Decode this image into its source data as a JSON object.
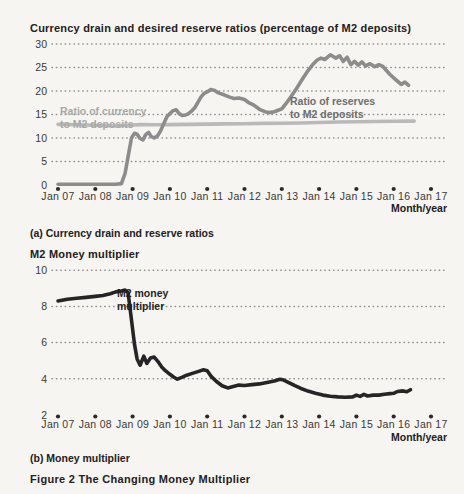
{
  "figure": {
    "caption": "Figure 2 The Changing Money Multiplier"
  },
  "chart_data": [
    {
      "type": "line",
      "title": "Currency drain and desired reserve ratios (percentage of M2 deposits)",
      "panel_label": "(a) Currency drain and reserve ratios",
      "xlabel": "Month/year",
      "x_unit": "years since Jan 2007",
      "x_tick_labels": [
        "Jan 07",
        "Jan 08",
        "Jan 09",
        "Jan 10",
        "Jan 11",
        "Jan 12",
        "Jan 13",
        "Jan 14",
        "Jan 15",
        "Jan 16",
        "Jan 17"
      ],
      "ylim": [
        0,
        30
      ],
      "y_tick_labels": [
        0,
        5,
        10,
        15,
        20,
        25,
        30
      ],
      "y_gridlines": [
        5,
        10,
        15,
        20,
        25,
        30
      ],
      "grid": "dotted-horizontal",
      "legend_position": "inline-labels",
      "series": [
        {
          "name": "Ratio of currency to M2 deposits",
          "label_lines": [
            "Ratio of currency",
            "to M2 deposits"
          ],
          "color": "#b9b9b9",
          "label_color": "#a8a8a8",
          "label_x": 60,
          "label_y": 115,
          "points": [
            [
              0,
              12.9
            ],
            [
              0.5,
              12.8
            ],
            [
              1.0,
              12.7
            ],
            [
              1.3,
              12.6
            ],
            [
              1.6,
              12.55
            ],
            [
              1.9,
              12.7
            ],
            [
              2.2,
              12.85
            ],
            [
              2.6,
              12.8
            ],
            [
              3.0,
              12.85
            ],
            [
              3.5,
              12.9
            ],
            [
              4.0,
              12.95
            ],
            [
              4.5,
              13.0
            ],
            [
              5.0,
              13.05
            ],
            [
              5.5,
              13.1
            ],
            [
              6.0,
              13.15
            ],
            [
              6.5,
              13.2
            ],
            [
              7.0,
              13.3
            ],
            [
              7.5,
              13.4
            ],
            [
              8.0,
              13.45
            ],
            [
              8.5,
              13.5
            ],
            [
              9.0,
              13.55
            ],
            [
              9.55,
              13.6
            ]
          ]
        },
        {
          "name": "Ratio of reserves to M2 deposits",
          "label_lines": [
            "Ratio of reserves",
            "to M2 deposits"
          ],
          "color": "#8c8c8c",
          "label_color": "#6e6e6e",
          "label_x": 290,
          "label_y": 105,
          "points": [
            [
              0,
              0.15
            ],
            [
              1.55,
              0.15
            ],
            [
              1.7,
              0.3
            ],
            [
              1.8,
              2.5
            ],
            [
              1.9,
              7.0
            ],
            [
              1.97,
              10.0
            ],
            [
              2.05,
              11.0
            ],
            [
              2.12,
              10.8
            ],
            [
              2.2,
              9.9
            ],
            [
              2.28,
              9.6
            ],
            [
              2.35,
              10.7
            ],
            [
              2.43,
              11.2
            ],
            [
              2.5,
              10.3
            ],
            [
              2.58,
              10.0
            ],
            [
              2.67,
              10.5
            ],
            [
              2.75,
              11.5
            ],
            [
              2.83,
              13.0
            ],
            [
              2.92,
              14.5
            ],
            [
              3.0,
              15.2
            ],
            [
              3.08,
              15.8
            ],
            [
              3.17,
              16.0
            ],
            [
              3.25,
              15.2
            ],
            [
              3.33,
              14.8
            ],
            [
              3.42,
              14.9
            ],
            [
              3.5,
              15.2
            ],
            [
              3.58,
              15.7
            ],
            [
              3.67,
              16.5
            ],
            [
              3.75,
              17.6
            ],
            [
              3.83,
              18.7
            ],
            [
              3.92,
              19.5
            ],
            [
              4.0,
              19.8
            ],
            [
              4.1,
              20.3
            ],
            [
              4.2,
              20.1
            ],
            [
              4.3,
              19.6
            ],
            [
              4.45,
              19.2
            ],
            [
              4.6,
              18.7
            ],
            [
              4.72,
              18.4
            ],
            [
              4.85,
              18.5
            ],
            [
              5.0,
              18.2
            ],
            [
              5.1,
              17.6
            ],
            [
              5.25,
              17.0
            ],
            [
              5.4,
              16.1
            ],
            [
              5.55,
              15.6
            ],
            [
              5.65,
              15.4
            ],
            [
              5.8,
              15.6
            ],
            [
              5.9,
              15.9
            ],
            [
              6.0,
              16.2
            ],
            [
              6.1,
              17.2
            ],
            [
              6.25,
              18.8
            ],
            [
              6.4,
              20.6
            ],
            [
              6.55,
              22.5
            ],
            [
              6.7,
              24.3
            ],
            [
              6.85,
              25.8
            ],
            [
              6.95,
              26.6
            ],
            [
              7.05,
              27.0
            ],
            [
              7.15,
              26.7
            ],
            [
              7.3,
              27.7
            ],
            [
              7.45,
              27.0
            ],
            [
              7.55,
              27.5
            ],
            [
              7.65,
              26.3
            ],
            [
              7.75,
              27.2
            ],
            [
              7.85,
              25.6
            ],
            [
              7.95,
              26.3
            ],
            [
              8.05,
              25.5
            ],
            [
              8.15,
              26.2
            ],
            [
              8.25,
              25.3
            ],
            [
              8.35,
              25.8
            ],
            [
              8.5,
              25.2
            ],
            [
              8.6,
              25.6
            ],
            [
              8.7,
              25.3
            ],
            [
              8.8,
              24.4
            ],
            [
              8.9,
              23.5
            ],
            [
              9.0,
              22.8
            ],
            [
              9.1,
              22.1
            ],
            [
              9.2,
              21.4
            ],
            [
              9.3,
              21.9
            ],
            [
              9.4,
              21.2
            ]
          ]
        }
      ]
    },
    {
      "type": "line",
      "title": "M2 Money multiplier",
      "panel_label": "(b) Money multiplier",
      "xlabel": "Month/year",
      "x_unit": "years since Jan 2007",
      "x_tick_labels": [
        "Jan 07",
        "Jan 08",
        "Jan 09",
        "Jan 10",
        "Jan 11",
        "Jan 12",
        "Jan 13",
        "Jan 14",
        "Jan 15",
        "Jan 16",
        "Jan 17"
      ],
      "ylim": [
        2,
        10
      ],
      "y_tick_labels": [
        2,
        4,
        6,
        8,
        10
      ],
      "y_gridlines": [
        4,
        6,
        8,
        10
      ],
      "grid": "dotted-horizontal",
      "legend_position": "inline-labels",
      "series": [
        {
          "name": "M2 money multiplier",
          "label_lines": [
            "M2 money",
            "multiplier"
          ],
          "color": "#252525",
          "label_color": "#1f1f1f",
          "label_x": 117,
          "label_y": 297,
          "points": [
            [
              0,
              8.3
            ],
            [
              0.25,
              8.4
            ],
            [
              0.5,
              8.45
            ],
            [
              0.75,
              8.5
            ],
            [
              1.0,
              8.55
            ],
            [
              1.2,
              8.6
            ],
            [
              1.4,
              8.7
            ],
            [
              1.55,
              8.8
            ],
            [
              1.7,
              8.85
            ],
            [
              1.8,
              8.9
            ],
            [
              1.88,
              8.75
            ],
            [
              1.95,
              7.6
            ],
            [
              2.05,
              5.9
            ],
            [
              2.12,
              5.1
            ],
            [
              2.2,
              4.75
            ],
            [
              2.3,
              5.25
            ],
            [
              2.38,
              4.85
            ],
            [
              2.48,
              5.15
            ],
            [
              2.58,
              5.2
            ],
            [
              2.68,
              4.95
            ],
            [
              2.78,
              4.65
            ],
            [
              2.88,
              4.45
            ],
            [
              3.0,
              4.25
            ],
            [
              3.1,
              4.1
            ],
            [
              3.2,
              3.98
            ],
            [
              3.32,
              4.08
            ],
            [
              3.45,
              4.2
            ],
            [
              3.6,
              4.3
            ],
            [
              3.75,
              4.4
            ],
            [
              3.9,
              4.5
            ],
            [
              4.0,
              4.45
            ],
            [
              4.1,
              4.15
            ],
            [
              4.25,
              3.85
            ],
            [
              4.4,
              3.62
            ],
            [
              4.55,
              3.5
            ],
            [
              4.7,
              3.58
            ],
            [
              4.85,
              3.65
            ],
            [
              5.0,
              3.63
            ],
            [
              5.2,
              3.68
            ],
            [
              5.4,
              3.72
            ],
            [
              5.6,
              3.8
            ],
            [
              5.8,
              3.88
            ],
            [
              5.95,
              3.97
            ],
            [
              6.05,
              3.93
            ],
            [
              6.2,
              3.78
            ],
            [
              6.35,
              3.62
            ],
            [
              6.5,
              3.48
            ],
            [
              6.7,
              3.32
            ],
            [
              6.9,
              3.2
            ],
            [
              7.1,
              3.1
            ],
            [
              7.3,
              3.04
            ],
            [
              7.5,
              3.0
            ],
            [
              7.7,
              2.98
            ],
            [
              7.9,
              3.0
            ],
            [
              8.0,
              3.1
            ],
            [
              8.1,
              3.03
            ],
            [
              8.2,
              3.14
            ],
            [
              8.3,
              3.05
            ],
            [
              8.45,
              3.1
            ],
            [
              8.6,
              3.1
            ],
            [
              8.75,
              3.15
            ],
            [
              8.9,
              3.18
            ],
            [
              9.0,
              3.2
            ],
            [
              9.1,
              3.3
            ],
            [
              9.25,
              3.33
            ],
            [
              9.35,
              3.28
            ],
            [
              9.45,
              3.4
            ]
          ]
        }
      ]
    }
  ],
  "style": {
    "background": "#f6f5f1",
    "grid_dot_color": "#8f8f8f",
    "tick_dot_color": "#2a2a2a",
    "text_color": "#242021",
    "axis_text_color": "#3c3836"
  }
}
